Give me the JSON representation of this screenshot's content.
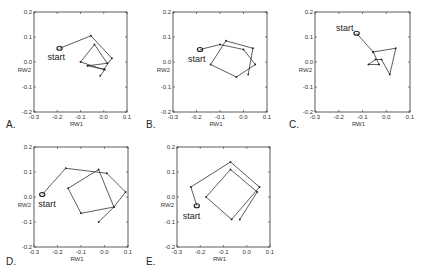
{
  "chart_data": [
    {
      "panel": "A.",
      "type": "line",
      "xlabel": "RW1",
      "ylabel": "RW2",
      "xlim": [
        -0.3,
        0.1
      ],
      "ylim": [
        -0.2,
        0.2
      ],
      "xticks": [
        "-0.3",
        "-0.2",
        "-0.1",
        "0.0",
        "0.1"
      ],
      "yticks": [
        "-0.2",
        "-0.1",
        "0.0",
        "0.1",
        "0.2"
      ],
      "start_label": "start",
      "start": [
        -0.19,
        0.055
      ],
      "path": [
        [
          -0.19,
          0.055
        ],
        [
          -0.055,
          0.105
        ],
        [
          0.035,
          0.015
        ],
        [
          0.0,
          -0.03
        ],
        [
          -0.1,
          0.0
        ],
        [
          -0.04,
          0.07
        ],
        [
          0.015,
          -0.005
        ],
        [
          -0.07,
          -0.015
        ],
        [
          0.005,
          -0.03
        ],
        [
          -0.015,
          -0.055
        ]
      ]
    },
    {
      "panel": "B.",
      "type": "line",
      "xlabel": "RW1",
      "ylabel": "RW2",
      "xlim": [
        -0.3,
        0.1
      ],
      "ylim": [
        -0.2,
        0.2
      ],
      "xticks": [
        "-0.3",
        "-0.2",
        "-0.1",
        "0.0",
        "0.1"
      ],
      "yticks": [
        "-0.2",
        "-0.1",
        "0.0",
        "0.1",
        "0.2"
      ],
      "start_label": "start",
      "start": [
        -0.185,
        0.05
      ],
      "path": [
        [
          -0.185,
          0.05
        ],
        [
          -0.1,
          0.07
        ],
        [
          0.0,
          0.05
        ],
        [
          0.05,
          -0.01
        ],
        [
          -0.03,
          -0.06
        ],
        [
          -0.14,
          -0.01
        ],
        [
          -0.075,
          0.085
        ],
        [
          0.04,
          0.055
        ],
        [
          0.02,
          -0.05
        ]
      ]
    },
    {
      "panel": "C.",
      "type": "line",
      "xlabel": "RW1",
      "ylabel": "RW2",
      "xlim": [
        -0.3,
        0.1
      ],
      "ylim": [
        -0.2,
        0.2
      ],
      "xticks": [
        "-0.3",
        "-0.2",
        "-0.1",
        "0.0",
        "0.1"
      ],
      "yticks": [
        "-0.2",
        "-0.1",
        "0.0",
        "0.1",
        "0.2"
      ],
      "start_label": "start",
      "start": [
        -0.125,
        0.115
      ],
      "path": [
        [
          -0.125,
          0.115
        ],
        [
          -0.055,
          0.04
        ],
        [
          0.04,
          0.055
        ],
        [
          0.015,
          -0.05
        ],
        [
          -0.02,
          0.01
        ],
        [
          -0.045,
          0.01
        ],
        [
          -0.075,
          -0.01
        ],
        [
          -0.03,
          -0.01
        ],
        [
          -0.055,
          0.04
        ]
      ]
    },
    {
      "panel": "D.",
      "type": "line",
      "xlabel": "RW1",
      "ylabel": "RW2",
      "xlim": [
        -0.3,
        0.1
      ],
      "ylim": [
        -0.2,
        0.2
      ],
      "xticks": [
        "-0.3",
        "-0.2",
        "-0.1",
        "0.0",
        "0.1"
      ],
      "yticks": [
        "-0.2",
        "-0.1",
        "0.0",
        "0.1",
        "0.2"
      ],
      "start_label": "start",
      "start": [
        -0.265,
        0.01
      ],
      "path": [
        [
          -0.265,
          0.01
        ],
        [
          -0.165,
          0.115
        ],
        [
          0.01,
          0.095
        ],
        [
          0.09,
          0.02
        ],
        [
          0.04,
          -0.04
        ],
        [
          -0.1,
          -0.065
        ],
        [
          -0.155,
          0.035
        ],
        [
          -0.025,
          0.11
        ],
        [
          0.04,
          -0.04
        ],
        [
          -0.025,
          -0.1
        ]
      ]
    },
    {
      "panel": "E.",
      "type": "line",
      "xlabel": "RW1",
      "ylabel": "RW2",
      "xlim": [
        -0.3,
        0.1
      ],
      "ylim": [
        -0.2,
        0.2
      ],
      "xticks": [
        "-0.3",
        "-0.2",
        "-0.1",
        "0.0",
        "0.1"
      ],
      "yticks": [
        "-0.2",
        "-0.1",
        "0.0",
        "0.1",
        "0.2"
      ],
      "start_label": "start",
      "start": [
        -0.215,
        -0.035
      ],
      "path": [
        [
          -0.215,
          -0.035
        ],
        [
          -0.24,
          0.04
        ],
        [
          -0.07,
          0.14
        ],
        [
          0.055,
          0.04
        ],
        [
          -0.065,
          -0.09
        ],
        [
          -0.175,
          0.0
        ],
        [
          -0.07,
          0.11
        ],
        [
          0.045,
          0.02
        ],
        [
          -0.03,
          -0.09
        ]
      ]
    }
  ],
  "layout": {
    "frames": [
      {
        "x0": 34,
        "x1": 127,
        "y0": 12,
        "y1": 112,
        "label_x": 6,
        "label_y": 128
      },
      {
        "x0": 173,
        "x1": 267,
        "y0": 12,
        "y1": 112,
        "label_x": 146,
        "label_y": 128
      },
      {
        "x0": 315,
        "x1": 410,
        "y0": 12,
        "y1": 112,
        "label_x": 289,
        "label_y": 128
      },
      {
        "x0": 34,
        "x1": 128,
        "y0": 147,
        "y1": 247,
        "label_x": 6,
        "label_y": 265
      },
      {
        "x0": 177,
        "x1": 270,
        "y0": 147,
        "y1": 247,
        "label_x": 146,
        "label_y": 265
      }
    ],
    "colors": {
      "frame": "#333333",
      "line": "#333333",
      "marker": "#222222",
      "text": "#333333"
    }
  }
}
